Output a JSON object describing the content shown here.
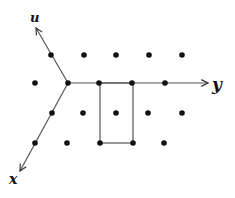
{
  "diagram": {
    "type": "lattice-with-axes",
    "colors": {
      "ink": "#111111",
      "line": "#555555",
      "background": "#ffffff"
    },
    "origin": {
      "x": 68,
      "y": 83
    },
    "axes": [
      {
        "name": "u",
        "label": "u",
        "from": [
          68,
          83
        ],
        "to": [
          36,
          28
        ],
        "label_pos": [
          30,
          22
        ]
      },
      {
        "name": "y",
        "label": "y",
        "from": [
          68,
          83
        ],
        "to": [
          208,
          83
        ],
        "label_pos": [
          212,
          90
        ]
      },
      {
        "name": "x",
        "label": "x",
        "from": [
          68,
          83
        ],
        "to": [
          20,
          171
        ],
        "label_pos": [
          9,
          184
        ]
      }
    ],
    "points": [
      [
        51,
        55
      ],
      [
        84,
        55
      ],
      [
        116,
        55
      ],
      [
        149,
        55
      ],
      [
        182,
        55
      ],
      [
        35,
        83
      ],
      [
        68,
        83
      ],
      [
        99,
        83
      ],
      [
        132,
        83
      ],
      [
        165,
        83
      ],
      [
        52,
        113
      ],
      [
        83,
        113
      ],
      [
        116,
        113
      ],
      [
        148,
        113
      ],
      [
        182,
        113
      ],
      [
        35,
        143
      ],
      [
        67,
        143
      ],
      [
        100,
        143
      ],
      [
        133,
        143
      ],
      [
        164,
        143
      ]
    ],
    "rectangle": {
      "x1": 100,
      "y1": 83,
      "x2": 133,
      "y2": 143
    }
  }
}
